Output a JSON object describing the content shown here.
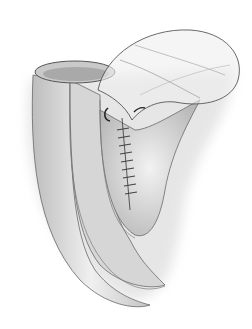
{
  "illustration": {
    "subject": "surgical illustration of intestinal loop anastomosis with running suture",
    "style": "grayscale pencil shading",
    "colors": {
      "background": "#ffffff",
      "outline": "#555555",
      "mid_tone": "#c8c8c8",
      "light_tone": "#e8e8e8",
      "shadow": "#9a9a9a"
    }
  }
}
